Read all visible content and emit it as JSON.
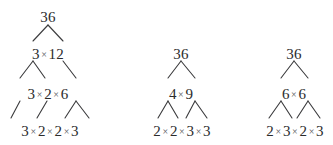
{
  "diagram": {
    "background_color": "#ffffff",
    "text_color": "#2b2b2b",
    "line_color": "#3a3a3c",
    "operator": "×",
    "trees": [
      {
        "name": "tree-left",
        "rows": [
          {
            "name": "root",
            "text": "36"
          },
          {
            "name": "level-1",
            "text": "3 × 12"
          },
          {
            "name": "level-2",
            "text": "3 × 2 × 6"
          },
          {
            "name": "level-3",
            "text": "3 × 2 × 2 × 3"
          }
        ]
      },
      {
        "name": "tree-middle",
        "rows": [
          {
            "name": "root",
            "text": "36"
          },
          {
            "name": "level-1",
            "text": "4 × 9"
          },
          {
            "name": "level-2",
            "text": "2 × 2 × 3 × 3"
          }
        ]
      },
      {
        "name": "tree-right",
        "rows": [
          {
            "name": "root",
            "text": "36"
          },
          {
            "name": "level-1",
            "text": "6 × 6"
          },
          {
            "name": "level-2",
            "text": "2 × 3 × 2 × 3"
          }
        ]
      }
    ]
  }
}
